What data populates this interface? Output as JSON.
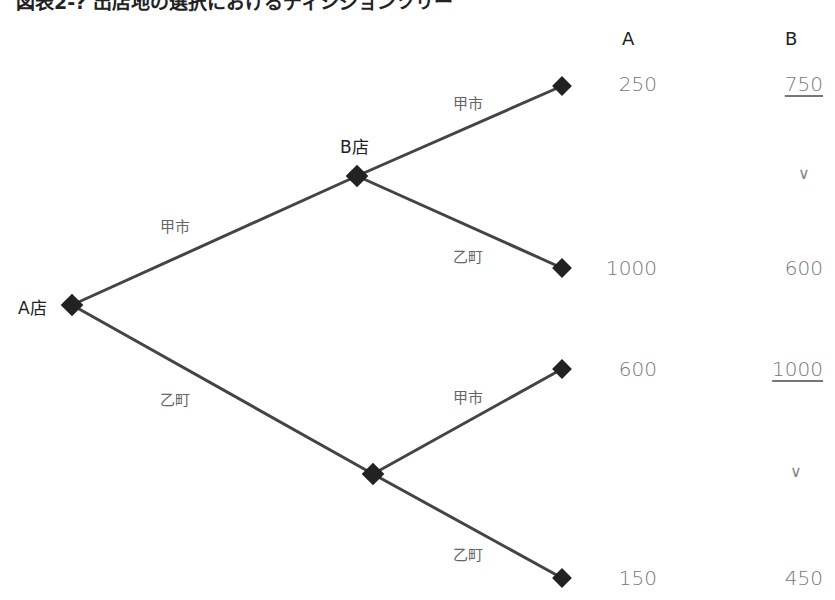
{
  "title": "図表2-? 出店地の選択におけるディシジョンツリー",
  "columns": [
    "A",
    "B"
  ],
  "nodes": {
    "root": "A店",
    "upper": "B店",
    "lower": ""
  },
  "branches": {
    "root_upper": "甲市",
    "root_lower": "乙町",
    "upper_up": "甲市",
    "upper_down": "乙町",
    "lower_up": "甲市",
    "lower_down": "乙町"
  },
  "outcomes": [
    {
      "A": "250",
      "B": "750",
      "B_underlined": true
    },
    {
      "A": "1000",
      "B": "600",
      "B_underlined": false
    },
    {
      "A": "600",
      "B": "1000",
      "B_underlined": true
    },
    {
      "A": "150",
      "B": "450",
      "B_underlined": false
    }
  ],
  "comparisons": [
    "∨",
    "∨"
  ],
  "colors": {
    "line": "#444444",
    "node": "#222222"
  }
}
